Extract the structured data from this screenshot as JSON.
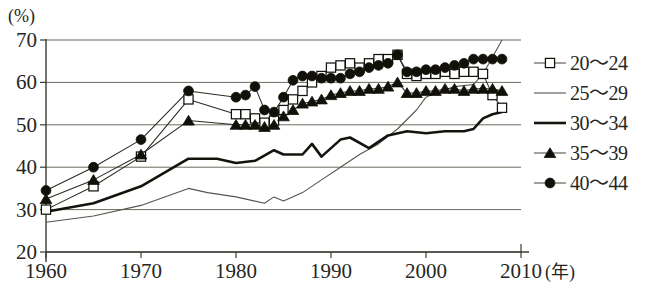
{
  "chart_data": {
    "type": "line",
    "title": "",
    "xlabel": "年",
    "ylabel": "%",
    "unit_label": "(%)",
    "year_label": "(年)",
    "xlim": [
      1960,
      2010
    ],
    "ylim": [
      20,
      70
    ],
    "ytick_values": [
      20,
      30,
      40,
      50,
      60,
      70
    ],
    "ytick_labels": [
      "20",
      "30",
      "40",
      "50",
      "60",
      "70"
    ],
    "xtick_values": [
      1960,
      1970,
      1980,
      1990,
      2000,
      2010
    ],
    "xtick_labels": [
      "1960",
      "1970",
      "1980",
      "1990",
      "2000",
      "2010"
    ],
    "grid": true,
    "grid_axis": "y",
    "legend_position": "right",
    "series": [
      {
        "name": "20～24",
        "marker": "open-square",
        "line": "thin",
        "x": [
          1960,
          1965,
          1970,
          1975,
          1980,
          1981,
          1982,
          1983,
          1984,
          1985,
          1986,
          1987,
          1988,
          1989,
          1990,
          1991,
          1992,
          1993,
          1994,
          1995,
          1996,
          1997,
          1998,
          1999,
          2000,
          2001,
          2002,
          2003,
          2004,
          2005,
          2006,
          2007,
          2008
        ],
        "values": [
          30.0,
          35.5,
          42.5,
          56.0,
          52.5,
          52.5,
          51.5,
          50.5,
          51.0,
          53.5,
          56.0,
          58.0,
          60.0,
          61.5,
          63.5,
          64.0,
          64.5,
          63.5,
          64.5,
          65.5,
          65.5,
          66.5,
          62.0,
          61.5,
          62.0,
          62.0,
          62.5,
          62.0,
          62.5,
          62.5,
          62.0,
          57.0,
          54.0
        ]
      },
      {
        "name": "25～29",
        "marker": "none",
        "line": "thin",
        "x": [
          1960,
          1965,
          1970,
          1975,
          1977,
          1980,
          1983,
          1984,
          1985,
          1987,
          1989,
          1991,
          1993,
          1995,
          1997,
          1999,
          2000,
          2001,
          2003,
          2005,
          2006,
          2007,
          2008
        ],
        "values": [
          27.0,
          28.5,
          31.0,
          35.0,
          34.0,
          33.0,
          31.5,
          33.0,
          32.0,
          34.0,
          37.0,
          40.0,
          43.0,
          45.5,
          49.0,
          53.5,
          56.5,
          57.5,
          59.0,
          59.5,
          62.0,
          66.0,
          70.0
        ]
      },
      {
        "name": "30～34",
        "marker": "none",
        "line": "thick",
        "x": [
          1960,
          1965,
          1970,
          1975,
          1978,
          1980,
          1982,
          1984,
          1985,
          1987,
          1988,
          1989,
          1990,
          1991,
          1992,
          1994,
          1996,
          1998,
          2000,
          2002,
          2004,
          2005,
          2006,
          2007,
          2008
        ],
        "values": [
          29.5,
          31.5,
          35.5,
          42.0,
          42.0,
          41.0,
          41.5,
          44.0,
          43.0,
          43.0,
          45.5,
          42.5,
          44.5,
          46.5,
          47.0,
          44.5,
          47.5,
          48.5,
          48.0,
          48.5,
          48.5,
          49.0,
          51.5,
          52.5,
          53.0
        ]
      },
      {
        "name": "35～39",
        "marker": "filled-triangle",
        "line": "thin",
        "x": [
          1960,
          1965,
          1970,
          1975,
          1980,
          1981,
          1982,
          1983,
          1984,
          1985,
          1986,
          1987,
          1988,
          1989,
          1990,
          1991,
          1992,
          1993,
          1994,
          1995,
          1996,
          1997,
          1998,
          1999,
          2000,
          2001,
          2002,
          2003,
          2004,
          2005,
          2006,
          2007,
          2008
        ],
        "values": [
          32.5,
          37.0,
          43.0,
          51.0,
          50.0,
          50.0,
          50.0,
          49.5,
          50.0,
          52.0,
          53.5,
          55.0,
          55.5,
          56.0,
          57.0,
          57.5,
          58.0,
          58.0,
          58.5,
          58.5,
          59.0,
          60.0,
          57.5,
          57.5,
          58.0,
          58.0,
          58.5,
          58.5,
          58.0,
          58.5,
          58.5,
          58.5,
          58.0
        ]
      },
      {
        "name": "40～44",
        "marker": "filled-circle",
        "line": "thin",
        "x": [
          1960,
          1965,
          1970,
          1975,
          1980,
          1981,
          1982,
          1983,
          1984,
          1985,
          1986,
          1987,
          1988,
          1989,
          1990,
          1991,
          1992,
          1993,
          1994,
          1995,
          1996,
          1997,
          1998,
          1999,
          2000,
          2001,
          2002,
          2003,
          2004,
          2005,
          2006,
          2007,
          2008
        ],
        "values": [
          34.5,
          40.0,
          46.5,
          58.0,
          56.5,
          57.0,
          59.0,
          53.5,
          53.0,
          56.5,
          60.5,
          61.5,
          61.5,
          61.0,
          61.0,
          61.0,
          62.0,
          62.5,
          63.5,
          64.0,
          64.5,
          66.5,
          62.5,
          62.5,
          63.0,
          63.0,
          63.5,
          64.0,
          64.5,
          65.5,
          65.5,
          65.5,
          65.5
        ]
      }
    ]
  },
  "legend": {
    "items": [
      {
        "label": "20～24",
        "key": "open-square"
      },
      {
        "label": "25～29",
        "key": "thin-line"
      },
      {
        "label": "30～34",
        "key": "thick-line"
      },
      {
        "label": "35～39",
        "key": "filled-triangle"
      },
      {
        "label": "40～44",
        "key": "filled-circle"
      }
    ]
  }
}
